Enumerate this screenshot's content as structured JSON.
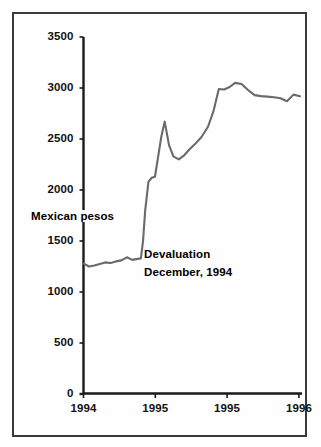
{
  "chart_data": {
    "type": "line",
    "title": "",
    "xlabel": "",
    "ylabel": "Mexican pesos",
    "ylim": [
      0,
      3500
    ],
    "yticks": [
      0,
      500,
      1000,
      1500,
      2000,
      2500,
      3000,
      3500
    ],
    "ytick_labels": [
      "0",
      "500",
      "1000",
      "1500",
      "2000",
      "2500",
      "3000",
      "3500"
    ],
    "xtick_labels": [
      "1994",
      "1995",
      "1995",
      "1996"
    ],
    "grid": false,
    "legend": null,
    "line_color": "#6a6a6a",
    "axis_color": "#1a1a1a",
    "annotations": [
      {
        "name": "devaluation-note",
        "line1": "Devaluation",
        "line2": "December, 1994"
      }
    ],
    "series": [
      {
        "name": "Mexican pesos per unit",
        "x": [
          0.0,
          0.025,
          0.05,
          0.075,
          0.1,
          0.125,
          0.15,
          0.175,
          0.2,
          0.225,
          0.25,
          0.265,
          0.275,
          0.285,
          0.3,
          0.315,
          0.33,
          0.345,
          0.36,
          0.375,
          0.395,
          0.415,
          0.44,
          0.465,
          0.49,
          0.515,
          0.545,
          0.575,
          0.6,
          0.625,
          0.65,
          0.675,
          0.7,
          0.73,
          0.76,
          0.79,
          0.82,
          0.85,
          0.88,
          0.91,
          0.94,
          0.97,
          1.0
        ],
        "values": [
          1280,
          1250,
          1260,
          1275,
          1290,
          1285,
          1300,
          1310,
          1340,
          1315,
          1325,
          1330,
          1500,
          1800,
          2080,
          2120,
          2130,
          2330,
          2530,
          2670,
          2440,
          2330,
          2300,
          2340,
          2400,
          2450,
          2520,
          2620,
          2770,
          2990,
          2985,
          3010,
          3050,
          3040,
          2980,
          2930,
          2920,
          2915,
          2910,
          2900,
          2870,
          2935,
          2920
        ]
      }
    ]
  }
}
